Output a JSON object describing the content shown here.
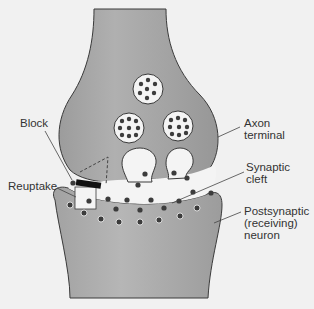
{
  "diagram": {
    "colors": {
      "background": "#f1f1f1",
      "neuron_fill": "#a8a8a8",
      "neuron_outline": "#3a3a3a",
      "vesicle_fill": "#f4f4f4",
      "molecule": "#3c3c3c",
      "block": "#111111",
      "label_text": "#333333"
    },
    "labels": {
      "block": "Block",
      "axon_terminal": "Axon\nterminal",
      "reuptake": "Reuptake",
      "synaptic_cleft": "Synaptic\ncleft",
      "postsynaptic_neuron": "Postsynaptic\n(receiving)\nneuron"
    },
    "vesicle_count": 3,
    "releasing_vesicle_count": 2
  }
}
